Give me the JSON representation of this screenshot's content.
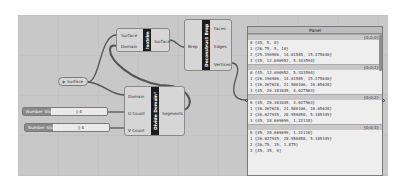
{
  "canvas": {
    "background": "#c8c8c8"
  },
  "nodes": {
    "isotrim": {
      "title": "Isotrim",
      "inputs": [
        "Surface",
        "Domain"
      ],
      "outputs": [
        "Surface"
      ]
    },
    "deconstruct_brep": {
      "title": "Deconstruct Brep",
      "inputs": [
        "Brep"
      ],
      "outputs": [
        "Faces",
        "Edges",
        "Vertices"
      ]
    },
    "divide_domain2": {
      "title": "Divide Domain²",
      "inputs": [
        "Domain",
        "U Count",
        "V Count"
      ],
      "outputs": [
        "Segments"
      ]
    }
  },
  "surface_param": {
    "label": "Surface"
  },
  "sliders": [
    {
      "label": "Number Slider",
      "value": "◊ 4"
    },
    {
      "label": "Number Slider",
      "value": "◊ 4"
    }
  ],
  "panel": {
    "title": "Panel",
    "branches": [
      {
        "path": "{0;0;0}",
        "items": [
          "0 {45, 5, 0}",
          "1 {26.75, 5, 10}",
          "2 {25.196906, 14.61585, 15.275646}",
          "3 {45, 12.690952, 5.333594}"
        ]
      },
      {
        "path": "{0;0;1}",
        "items": [
          "0 {45, 12.690952, 5.333594}",
          "1 {26.196906, 14.61585, 15.275646}",
          "2 {26.267628, 21.580106, 10.65628}",
          "3 {45, 20.381845, 4.027563}"
        ]
      },
      {
        "path": "{0;0;2}",
        "items": [
          "0 {45, 20.381845, 4.027563}",
          "1 {26.267628, 21.580106, 10.65628}",
          "2 {26.627935, 28.950058, 5.185349}",
          "3 {45, 28.669699, 1.22118}"
        ]
      },
      {
        "path": "{0;0;3}",
        "items": [
          "0 {45, 28.669699, 1.22118}",
          "1 {26.627935, 28.950058, 5.185349}",
          "2 {26.75, 35, 1.875}",
          "3 {45, 35, 0}"
        ]
      }
    ]
  }
}
